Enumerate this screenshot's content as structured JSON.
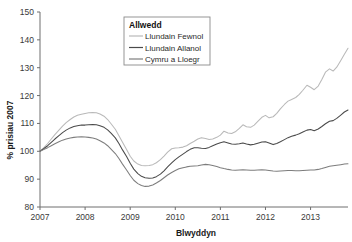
{
  "chart_data": {
    "type": "line",
    "title": "",
    "xlabel": "Blwyddyn",
    "ylabel": "% prisiau 2007",
    "xlim": [
      2007.0,
      2013.83
    ],
    "ylim": [
      80,
      150
    ],
    "yticks": [
      80,
      90,
      100,
      110,
      120,
      130,
      140,
      150
    ],
    "xticks": [
      2007,
      2008,
      2009,
      2010,
      2011,
      2012,
      2013
    ],
    "xtick_labels": [
      "2007",
      "2008",
      "2009",
      "2010",
      "2011",
      "2012",
      "2013"
    ],
    "ytick_labels": [
      "80",
      "90",
      "100",
      "110",
      "120",
      "130",
      "140",
      "150"
    ],
    "grid": false,
    "legend_position": "top-center",
    "legend_title": "Allwedd",
    "x": [
      2007.0,
      2007.08,
      2007.17,
      2007.25,
      2007.33,
      2007.42,
      2007.5,
      2007.58,
      2007.67,
      2007.75,
      2007.83,
      2007.92,
      2008.0,
      2008.08,
      2008.17,
      2008.25,
      2008.33,
      2008.42,
      2008.5,
      2008.58,
      2008.67,
      2008.75,
      2008.83,
      2008.92,
      2009.0,
      2009.08,
      2009.17,
      2009.25,
      2009.33,
      2009.42,
      2009.5,
      2009.58,
      2009.67,
      2009.75,
      2009.83,
      2009.92,
      2010.0,
      2010.08,
      2010.17,
      2010.25,
      2010.33,
      2010.42,
      2010.5,
      2010.58,
      2010.67,
      2010.75,
      2010.83,
      2010.92,
      2011.0,
      2011.08,
      2011.17,
      2011.25,
      2011.33,
      2011.42,
      2011.5,
      2011.58,
      2011.67,
      2011.75,
      2011.83,
      2011.92,
      2012.0,
      2012.08,
      2012.17,
      2012.25,
      2012.33,
      2012.42,
      2012.5,
      2012.58,
      2012.67,
      2012.75,
      2012.83,
      2012.92,
      2013.0,
      2013.08,
      2013.17,
      2013.25,
      2013.33,
      2013.42,
      2013.5,
      2013.58,
      2013.67,
      2013.75,
      2013.83
    ],
    "series": [
      {
        "name": "Llundain Fewnol",
        "color": "#b9b9b9",
        "values": [
          100.0,
          101.2,
          102.8,
          104.4,
          106.0,
          107.6,
          109.0,
          110.3,
          111.4,
          112.3,
          112.9,
          113.3,
          113.6,
          113.8,
          113.9,
          113.8,
          113.4,
          112.6,
          111.4,
          109.8,
          107.9,
          105.6,
          103.2,
          100.6,
          98.2,
          96.5,
          95.4,
          94.9,
          94.8,
          94.9,
          95.2,
          95.9,
          97.0,
          98.3,
          99.7,
          100.9,
          101.2,
          101.3,
          101.5,
          102.0,
          102.8,
          103.6,
          104.4,
          104.9,
          104.6,
          104.2,
          104.4,
          105.0,
          105.8,
          107.2,
          106.6,
          106.4,
          107.0,
          108.2,
          109.5,
          108.8,
          108.6,
          109.4,
          110.7,
          112.2,
          112.9,
          112.0,
          112.4,
          113.6,
          115.2,
          116.8,
          118.0,
          118.6,
          119.3,
          120.4,
          121.9,
          123.7,
          123.0,
          122.1,
          123.4,
          125.8,
          128.4,
          129.6,
          128.8,
          130.2,
          132.6,
          134.8,
          137.0
        ]
      },
      {
        "name": "Llundain Allanol",
        "color": "#4a4a4a",
        "values": [
          100.0,
          100.9,
          102.0,
          103.2,
          104.4,
          105.6,
          106.7,
          107.6,
          108.4,
          108.9,
          109.2,
          109.4,
          109.4,
          109.5,
          109.6,
          109.5,
          109.2,
          108.6,
          107.7,
          106.4,
          104.8,
          102.8,
          100.5,
          98.1,
          95.7,
          93.6,
          92.0,
          91.0,
          90.5,
          90.3,
          90.4,
          90.9,
          91.8,
          93.0,
          94.4,
          95.8,
          97.0,
          98.0,
          99.0,
          99.9,
          100.7,
          101.3,
          101.3,
          101.1,
          101.0,
          101.4,
          102.0,
          102.6,
          103.1,
          103.4,
          103.0,
          102.6,
          102.5,
          102.7,
          103.0,
          102.6,
          102.3,
          102.5,
          102.9,
          103.3,
          103.4,
          103.0,
          102.4,
          102.8,
          103.4,
          104.2,
          104.9,
          105.4,
          105.8,
          106.3,
          106.9,
          107.6,
          107.8,
          107.4,
          108.0,
          108.9,
          109.9,
          110.8,
          111.0,
          111.8,
          113.0,
          114.1,
          114.8
        ]
      },
      {
        "name": "Cymru a Lloegr",
        "color": "#7d7d7d",
        "values": [
          100.0,
          100.6,
          101.3,
          102.0,
          102.7,
          103.4,
          104.0,
          104.4,
          104.8,
          105.0,
          105.1,
          105.2,
          105.1,
          105.0,
          104.8,
          104.4,
          103.8,
          103.0,
          102.0,
          100.7,
          99.2,
          97.4,
          95.4,
          93.3,
          91.3,
          89.6,
          88.4,
          87.7,
          87.4,
          87.5,
          87.9,
          88.6,
          89.5,
          90.5,
          91.5,
          92.4,
          93.1,
          93.7,
          94.1,
          94.4,
          94.6,
          94.7,
          94.8,
          95.1,
          95.3,
          95.2,
          94.9,
          94.5,
          94.1,
          93.8,
          93.5,
          93.3,
          93.2,
          93.3,
          93.4,
          93.3,
          93.2,
          93.2,
          93.3,
          93.4,
          93.3,
          93.1,
          92.9,
          92.8,
          92.9,
          93.0,
          93.1,
          93.1,
          93.0,
          93.0,
          93.1,
          93.2,
          93.3,
          93.3,
          93.5,
          93.8,
          94.2,
          94.6,
          94.8,
          95.0,
          95.2,
          95.4,
          95.5
        ]
      }
    ]
  },
  "legend": {
    "title": "Allwedd",
    "items": [
      {
        "label": "Llundain Fewnol",
        "color": "#b9b9b9"
      },
      {
        "label": "Llundain Allanol",
        "color": "#4a4a4a"
      },
      {
        "label": "Cymru a Lloegr",
        "color": "#7d7d7d"
      }
    ]
  },
  "axes": {
    "x_title": "Blwyddyn",
    "y_title": "% prisiau 2007"
  }
}
